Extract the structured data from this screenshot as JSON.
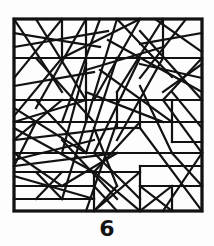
{
  "figure": {
    "caption": "6",
    "kind": "random-line-segment-pattern",
    "background_color": "#fdfdfd",
    "ink_color": "#121212",
    "frame": {
      "x": 14,
      "y": 19,
      "width": 188,
      "height": 192,
      "stroke_width": 3.2
    },
    "segment_stroke_width": 2.2,
    "segments": [
      [
        14,
        19,
        202,
        19
      ],
      [
        202,
        19,
        202,
        211
      ],
      [
        202,
        211,
        14,
        211
      ],
      [
        14,
        211,
        14,
        19
      ],
      [
        14,
        58,
        202,
        58
      ],
      [
        14,
        100,
        202,
        100
      ],
      [
        14,
        122,
        202,
        122
      ],
      [
        14,
        153,
        202,
        153
      ],
      [
        14,
        172,
        140,
        172
      ],
      [
        14,
        186,
        94,
        186
      ],
      [
        14,
        199,
        94,
        199
      ],
      [
        94,
        172,
        94,
        211
      ],
      [
        140,
        166,
        140,
        211
      ],
      [
        140,
        166,
        202,
        166
      ],
      [
        172,
        186,
        172,
        211
      ],
      [
        140,
        186,
        202,
        186
      ],
      [
        172,
        100,
        172,
        142
      ],
      [
        172,
        142,
        202,
        142
      ],
      [
        172,
        122,
        202,
        122
      ],
      [
        117,
        92,
        117,
        128
      ],
      [
        117,
        128,
        140,
        128
      ],
      [
        140,
        100,
        140,
        128
      ],
      [
        86,
        19,
        86,
        122
      ],
      [
        62,
        19,
        62,
        58
      ],
      [
        163,
        19,
        163,
        58
      ],
      [
        14,
        19,
        62,
        92
      ],
      [
        62,
        19,
        14,
        78
      ],
      [
        14,
        33,
        100,
        47
      ],
      [
        36,
        19,
        86,
        100
      ],
      [
        86,
        19,
        36,
        108
      ],
      [
        14,
        47,
        108,
        31
      ],
      [
        100,
        19,
        62,
        122
      ],
      [
        62,
        58,
        140,
        19
      ],
      [
        117,
        19,
        86,
        122
      ],
      [
        140,
        19,
        94,
        100
      ],
      [
        117,
        19,
        172,
        77
      ],
      [
        163,
        19,
        117,
        92
      ],
      [
        186,
        19,
        140,
        78
      ],
      [
        202,
        33,
        140,
        44
      ],
      [
        155,
        19,
        202,
        52
      ],
      [
        202,
        58,
        163,
        100
      ],
      [
        140,
        31,
        202,
        100
      ],
      [
        108,
        40,
        202,
        92
      ],
      [
        86,
        70,
        163,
        47
      ],
      [
        140,
        64,
        202,
        78
      ],
      [
        202,
        64,
        163,
        92
      ],
      [
        14,
        86,
        94,
        72
      ],
      [
        36,
        58,
        94,
        122
      ],
      [
        62,
        58,
        14,
        116
      ],
      [
        86,
        64,
        62,
        153
      ],
      [
        117,
        58,
        86,
        153
      ],
      [
        100,
        70,
        172,
        122
      ],
      [
        140,
        58,
        94,
        153
      ],
      [
        163,
        58,
        117,
        140
      ],
      [
        86,
        92,
        163,
        122
      ],
      [
        14,
        108,
        86,
        153
      ],
      [
        14,
        122,
        86,
        100
      ],
      [
        36,
        100,
        86,
        153
      ],
      [
        62,
        100,
        14,
        140
      ],
      [
        140,
        86,
        172,
        153
      ],
      [
        163,
        100,
        202,
        153
      ],
      [
        172,
        92,
        202,
        128
      ],
      [
        14,
        128,
        94,
        172
      ],
      [
        14,
        140,
        117,
        128
      ],
      [
        14,
        153,
        62,
        186
      ],
      [
        36,
        122,
        14,
        166
      ],
      [
        62,
        140,
        117,
        199
      ],
      [
        86,
        122,
        62,
        199
      ],
      [
        94,
        128,
        117,
        186
      ],
      [
        117,
        122,
        86,
        211
      ],
      [
        140,
        122,
        94,
        172
      ],
      [
        117,
        153,
        62,
        186
      ],
      [
        14,
        166,
        117,
        153
      ],
      [
        94,
        153,
        140,
        199
      ],
      [
        140,
        128,
        202,
        211
      ],
      [
        172,
        153,
        202,
        186
      ],
      [
        202,
        153,
        163,
        211
      ],
      [
        140,
        172,
        94,
        211
      ],
      [
        94,
        172,
        140,
        211
      ],
      [
        94,
        186,
        117,
        211
      ],
      [
        117,
        186,
        94,
        211
      ],
      [
        140,
        186,
        172,
        211
      ],
      [
        172,
        186,
        140,
        211
      ],
      [
        36,
        172,
        62,
        199
      ],
      [
        62,
        172,
        36,
        199
      ],
      [
        14,
        176,
        94,
        199
      ],
      [
        94,
        140,
        14,
        160
      ]
    ]
  }
}
